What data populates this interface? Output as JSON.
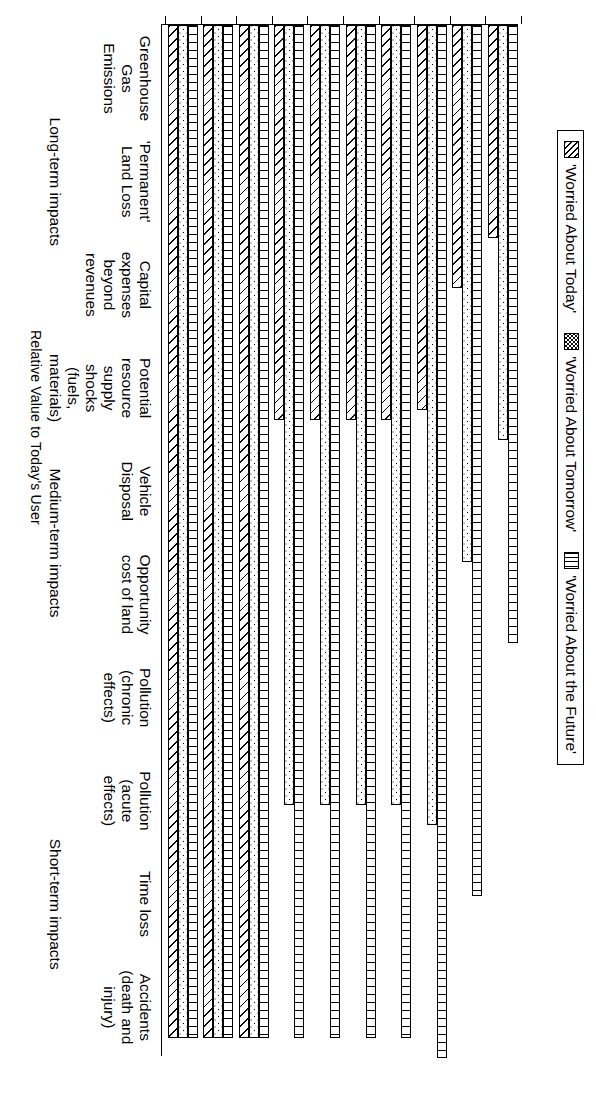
{
  "legend": {
    "entries": [
      {
        "label": "'Worried About Today'",
        "icon": "diagonal-hatch-swatch"
      },
      {
        "label": "'Worried About Tomorrow'",
        "icon": "dotted-swatch"
      },
      {
        "label": "'Worried About the Future'",
        "icon": "vertical-line-swatch"
      }
    ]
  },
  "axis": {
    "value_axis_title": "Relative Value to Today's User"
  },
  "phases": [
    {
      "label": "Short-term impacts",
      "span": [
        0,
        2
      ]
    },
    {
      "label": "Medium-term impacts",
      "span": [
        3,
        6
      ]
    },
    {
      "label": "Long-term impacts",
      "span": [
        7,
        9
      ]
    }
  ],
  "chart_data": {
    "type": "bar",
    "orientation": "horizontal",
    "title": "",
    "xlabel": "",
    "ylabel": "Relative Value to Today's User",
    "ylim": [
      0,
      1.05
    ],
    "grid": false,
    "legend_position": "top",
    "categories": [
      "Accidents\n(death and\ninjury)",
      "Time loss",
      "Pollution\n(acute\neffects)",
      "Pollution\n(chronic\neffects)",
      "Opportunity\ncost of land",
      "Vehicle\nDisposal",
      "Potential\nresource\nsupply\nshocks\n(fuels,\nmaterials)",
      "Capital\nexpenses\nbeyond\nrevenues",
      "'Permanent'\nLand Loss",
      "Greenhouse\nGas\nEmissions"
    ],
    "series": [
      {
        "name": "'Worried About Today'",
        "pattern": "diagonal-hatch",
        "values": [
          1.0,
          1.0,
          1.0,
          0.39,
          0.39,
          0.39,
          0.39,
          0.38,
          0.26,
          0.21
        ]
      },
      {
        "name": "'Worried About Tomorrow'",
        "pattern": "dots",
        "values": [
          1.0,
          1.0,
          1.0,
          0.77,
          0.77,
          0.77,
          0.77,
          0.79,
          0.53,
          0.41
        ]
      },
      {
        "name": "'Worried About the Future'",
        "pattern": "vertical-lines",
        "values": [
          1.0,
          1.0,
          1.0,
          1.0,
          1.0,
          1.0,
          1.0,
          1.02,
          0.86,
          0.61
        ]
      }
    ]
  }
}
